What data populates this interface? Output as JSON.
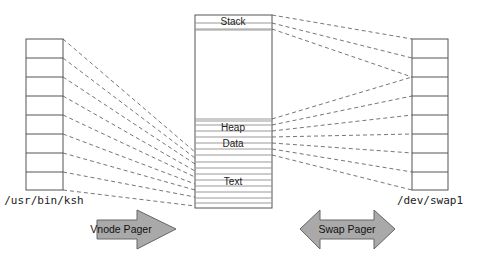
{
  "diagram": {
    "title": "",
    "colors": {
      "stroke": "#555555",
      "band": "#888888",
      "arrow_fill": "#a9a9a9",
      "arrow_stroke": "#666666",
      "text": "#222222"
    },
    "left_file": {
      "label": "/usr/bin/ksh",
      "cells": 8
    },
    "right_file": {
      "label": "/dev/swap1",
      "cells": 8
    },
    "address_space": {
      "segments": [
        {
          "name": "stack",
          "label": "Stack"
        },
        {
          "name": "heap",
          "label": "Heap"
        },
        {
          "name": "data",
          "label": "Data"
        },
        {
          "name": "text",
          "label": "Text"
        }
      ]
    },
    "arrows": {
      "vnode_pager": {
        "label": "Vnode Pager",
        "direction": "right"
      },
      "swap_pager": {
        "label": "Swap Pager",
        "direction": "both"
      }
    }
  }
}
